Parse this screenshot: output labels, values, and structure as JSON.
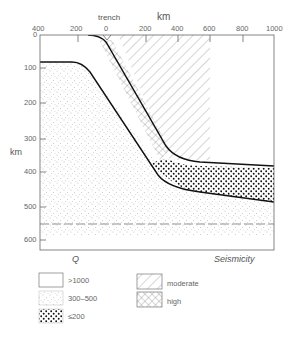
{
  "figure": {
    "top_axis_label": "km",
    "trench_label": "trench",
    "left_axis_label": "km",
    "x_ticks": [
      "400",
      "200",
      "0",
      "200",
      "400",
      "600",
      "800",
      "1000"
    ],
    "y_ticks": [
      "0",
      "100",
      "200",
      "300",
      "400",
      "500",
      "600"
    ],
    "q_label": "Q",
    "seismicity_label": "Seismicity"
  },
  "legend": {
    "q_items": [
      {
        "label": ">1000",
        "pattern": "blank"
      },
      {
        "label": "300–500",
        "pattern": "fine-dots"
      },
      {
        "label": "≤200",
        "pattern": "coarse-dots"
      }
    ],
    "seismicity_items": [
      {
        "label": "moderate",
        "pattern": "diagonal-hatch"
      },
      {
        "label": "high",
        "pattern": "cross-hatch"
      }
    ]
  }
}
